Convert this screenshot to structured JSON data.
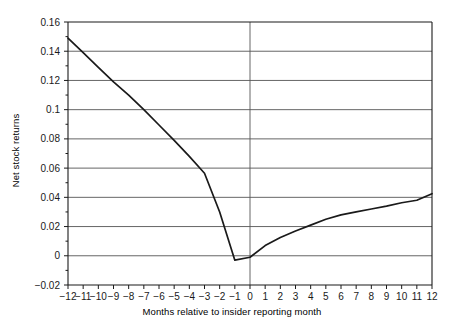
{
  "chart_data": {
    "type": "line",
    "title": "",
    "xlabel": "Months relative to insider reporting month",
    "ylabel": "Net stock returns",
    "xlim": [
      -12,
      12
    ],
    "ylim": [
      -0.02,
      0.16
    ],
    "grid": true,
    "legend": false,
    "legend_position": "none",
    "x_tick_labels": [
      "−12",
      "−11",
      "−10",
      "−9",
      "−8",
      "−7",
      "−6",
      "−5",
      "−4",
      "−3",
      "−2",
      "−1",
      "0",
      "1",
      "2",
      "3",
      "4",
      "5",
      "6",
      "7",
      "8",
      "9",
      "10",
      "11",
      "12"
    ],
    "y_tick_labels": [
      "−0.02",
      "0",
      "0.02",
      "0.04",
      "0.06",
      "0.08",
      "0.1",
      "0.12",
      "0.14",
      "0.16"
    ],
    "y_tick_values": [
      -0.02,
      0,
      0.02,
      0.04,
      0.06,
      0.08,
      0.1,
      0.12,
      0.14,
      0.16
    ],
    "x": [
      -12,
      -11,
      -10,
      -9,
      -8,
      -7,
      -6,
      -5,
      -4,
      -3,
      -2,
      -1,
      0,
      1,
      2,
      3,
      4,
      5,
      6,
      7,
      8,
      9,
      10,
      11,
      12
    ],
    "values": [
      0.149,
      0.139,
      0.129,
      0.119,
      0.11,
      0.1,
      0.0895,
      0.079,
      0.068,
      0.0565,
      0.03,
      -0.003,
      -0.001,
      0.007,
      0.0125,
      0.017,
      0.021,
      0.025,
      0.028,
      0.03,
      0.032,
      0.034,
      0.0363,
      0.038,
      0.0425
    ],
    "series": [
      {
        "name": "Net stock returns",
        "color": "#1a1a1a",
        "values": [
          0.149,
          0.139,
          0.129,
          0.119,
          0.11,
          0.1,
          0.0895,
          0.079,
          0.068,
          0.0565,
          0.03,
          -0.003,
          -0.001,
          0.007,
          0.0125,
          0.017,
          0.021,
          0.025,
          0.028,
          0.03,
          0.032,
          0.034,
          0.0363,
          0.038,
          0.0425
        ]
      }
    ],
    "annotations": [
      {
        "name": "zero-month-vertical-line",
        "x": 0
      }
    ],
    "colors": {
      "axis": "#1a1a1a",
      "grid": "#555555",
      "line": "#1a1a1a",
      "background": "#ffffff",
      "text": "#1a1a1a"
    }
  }
}
